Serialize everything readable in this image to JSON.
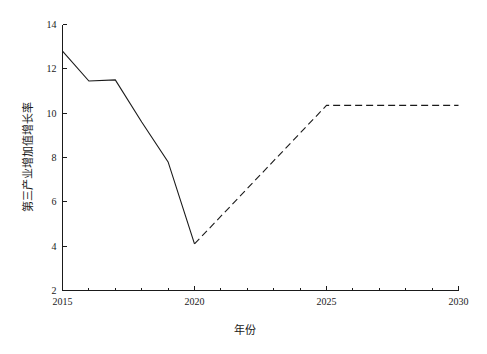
{
  "chart_data": {
    "type": "line",
    "title": "",
    "subtitle": "",
    "xlabel": "年份",
    "ylabel": "第三产业增加值增长率",
    "xlim": [
      2015,
      2030
    ],
    "ylim": [
      2,
      14
    ],
    "grid": false,
    "legend": null,
    "x_ticks": [
      2015,
      2020,
      2025,
      2030
    ],
    "x_tick_labels": [
      "2015",
      "2020",
      "2025",
      "2030"
    ],
    "x_minor_ticks": [
      2016,
      2017,
      2018,
      2019,
      2021,
      2022,
      2023,
      2024,
      2026,
      2027,
      2028,
      2029
    ],
    "y_ticks": [
      2,
      4,
      6,
      8,
      10,
      12,
      14
    ],
    "y_tick_labels": [
      "2",
      "4",
      "6",
      "8",
      "10",
      "12",
      "14"
    ],
    "series": [
      {
        "name": "历史值",
        "style": "solid",
        "color": "#1a1a1a",
        "x": [
          2015,
          2016,
          2017,
          2018,
          2019,
          2020
        ],
        "values": [
          12.8,
          11.45,
          11.5,
          9.6,
          7.8,
          4.1
        ]
      },
      {
        "name": "预测值",
        "style": "dashed",
        "color": "#1a1a1a",
        "x": [
          2020,
          2025,
          2030
        ],
        "values": [
          4.1,
          10.35,
          10.35
        ]
      }
    ]
  },
  "axis_titles": {
    "x": "年份",
    "y": "第三产业增加值增长率"
  }
}
